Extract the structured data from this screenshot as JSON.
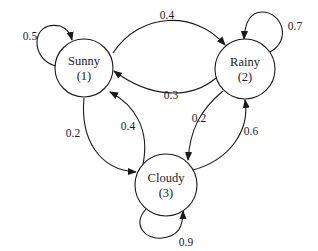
{
  "diagram": {
    "type": "markov-chain",
    "nodes": [
      {
        "id": 1,
        "name": "Sunny",
        "index_label": "(1)"
      },
      {
        "id": 2,
        "name": "Rainy",
        "index_label": "(2)"
      },
      {
        "id": 3,
        "name": "Cloudy",
        "index_label": "(3)"
      }
    ],
    "edges": [
      {
        "from": "Sunny",
        "to": "Sunny",
        "label": "0.5"
      },
      {
        "from": "Sunny",
        "to": "Rainy",
        "label": "0.4"
      },
      {
        "from": "Rainy",
        "to": "Sunny",
        "label": "0.3"
      },
      {
        "from": "Rainy",
        "to": "Rainy",
        "label": "0.7"
      },
      {
        "from": "Sunny",
        "to": "Cloudy",
        "label": "0.2"
      },
      {
        "from": "Cloudy",
        "to": "Sunny",
        "label": "0.4"
      },
      {
        "from": "Rainy",
        "to": "Cloudy",
        "label": "0.2"
      },
      {
        "from": "Cloudy",
        "to": "Rainy",
        "label": "0.6"
      },
      {
        "from": "Cloudy",
        "to": "Cloudy",
        "label": "0.9"
      }
    ],
    "colors": {
      "stroke": "#1a1a1a",
      "background": "#ffffff"
    }
  }
}
